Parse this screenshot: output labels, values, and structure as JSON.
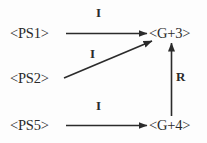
{
  "diagram": {
    "type": "directed-graph",
    "title": "",
    "background_color": "#fdfdfd",
    "line_color": "#2b2b2b",
    "text_color": "#2a2a2a",
    "nodes": [
      {
        "id": "ps1",
        "label": "<PS1>",
        "x": 36,
        "y": 33
      },
      {
        "id": "ps2",
        "label": "<PS2>",
        "x": 36,
        "y": 78
      },
      {
        "id": "ps5",
        "label": "<PS5>",
        "x": 36,
        "y": 125
      },
      {
        "id": "g3",
        "label": "<G+3>",
        "x": 176,
        "y": 33
      },
      {
        "id": "g4",
        "label": "<G+4>",
        "x": 176,
        "y": 125
      }
    ],
    "edges": [
      {
        "id": "ps1-g3",
        "from": "ps1",
        "to": "g3",
        "label": "I",
        "style": "solid",
        "arrow": "end",
        "orientation": "horizontal"
      },
      {
        "id": "ps2-g3",
        "from": "ps2",
        "to": "g3",
        "label": "I",
        "style": "solid",
        "arrow": "end",
        "orientation": "diagonal-up"
      },
      {
        "id": "ps5-g4",
        "from": "ps5",
        "to": "g4",
        "label": "I",
        "style": "solid",
        "arrow": "end",
        "orientation": "horizontal"
      },
      {
        "id": "g4-g3",
        "from": "g4",
        "to": "g3",
        "label": "R",
        "style": "solid",
        "arrow": "end",
        "orientation": "vertical-up"
      }
    ]
  }
}
